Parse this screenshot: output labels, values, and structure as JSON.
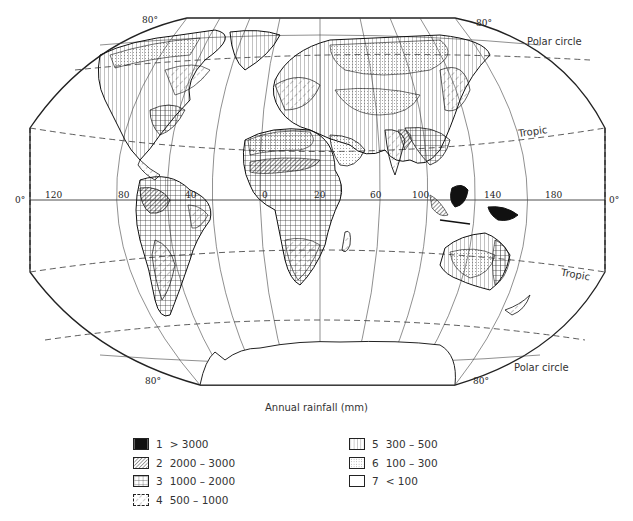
{
  "map": {
    "title": "Annual rainfall (mm)",
    "projection": "world map, elliptical-like projection",
    "latitude_labels": {
      "north_80_left": "80°",
      "north_80_right": "80°",
      "south_80_left": "80°",
      "south_80_right": "80°",
      "equator_left": "0°",
      "equator_right": "0°"
    },
    "longitude_labels": [
      "120",
      "80",
      "40",
      "0",
      "20",
      "60",
      "100",
      "140",
      "180"
    ],
    "line_labels": {
      "polar_circle_north": "Polar circle",
      "tropic_north": "Tropic",
      "tropic_south": "Tropic",
      "polar_circle_south": "Polar circle"
    }
  },
  "legend": {
    "items": [
      {
        "number": "1",
        "range": "> 3000",
        "pattern": "solid-black"
      },
      {
        "number": "2",
        "range": "2000 – 3000",
        "pattern": "dense-diagonal-hatch"
      },
      {
        "number": "3",
        "range": "1000 – 2000",
        "pattern": "grid-crosshatch"
      },
      {
        "number": "4",
        "range": "500 – 1000",
        "pattern": "sparse-dashed-diagonal"
      },
      {
        "number": "5",
        "range": "300 – 500",
        "pattern": "vertical-lines"
      },
      {
        "number": "6",
        "range": "100 – 300",
        "pattern": "stipple-dots"
      },
      {
        "number": "7",
        "range": "< 100",
        "pattern": "blank"
      }
    ]
  },
  "colors": {
    "ink": "#1a1a1a",
    "paper": "#ffffff"
  }
}
